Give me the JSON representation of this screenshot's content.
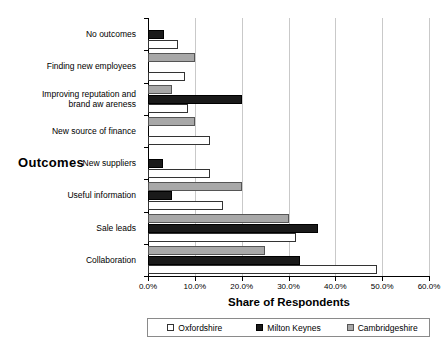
{
  "chart_data": {
    "type": "bar",
    "orientation": "horizontal",
    "title": "",
    "xlabel": "Share of Respondents",
    "ylabel": "Outcomes",
    "xlim": [
      0,
      60
    ],
    "xticks": [
      "0.0%",
      "10.0%",
      "20.0%",
      "30.0%",
      "40.0%",
      "50.0%",
      "60.0%"
    ],
    "xtick_values": [
      0,
      10,
      20,
      30,
      40,
      50,
      60
    ],
    "grid": true,
    "legend_position": "bottom",
    "categories": [
      "No outcomes",
      "Finding new employees",
      "Improving reputation and brand aw areness",
      "New source of finance",
      "New suppliers",
      "Useful information",
      "Sale leads",
      "Collaboration"
    ],
    "category_lines": [
      [
        "No outcomes"
      ],
      [
        "Finding new employees"
      ],
      [
        "Improving reputation and",
        "brand aw areness"
      ],
      [
        "New source of finance"
      ],
      [
        "New suppliers"
      ],
      [
        "Useful information"
      ],
      [
        "Sale leads"
      ],
      [
        "Collaboration"
      ]
    ],
    "series": [
      {
        "name": "Oxfordshire",
        "key": "ox",
        "color": "#ffffff",
        "values": [
          6.5,
          7.9,
          8.5,
          13.3,
          13.3,
          16.0,
          31.6,
          49.0
        ]
      },
      {
        "name": "Milton Keynes",
        "key": "mk",
        "color": "#1a1a1a",
        "values": [
          3.5,
          0,
          20.0,
          0,
          3.2,
          5.2,
          36.3,
          32.5
        ]
      },
      {
        "name": "Cambridgeshire",
        "key": "cb",
        "color": "#a8a8a8",
        "values": [
          0,
          10.0,
          5.1,
          10.0,
          0,
          20.0,
          30.0,
          25.0
        ]
      }
    ]
  },
  "legend": {
    "items": [
      {
        "label": "Oxfordshire",
        "key": "ox"
      },
      {
        "label": "Milton Keynes",
        "key": "mk"
      },
      {
        "label": "Cambridgeshire",
        "key": "cb"
      }
    ]
  }
}
